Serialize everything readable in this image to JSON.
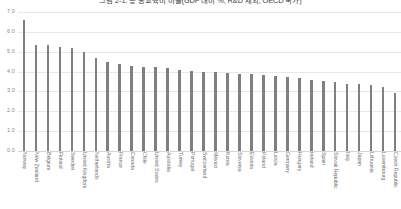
{
  "chart_data": {
    "type": "bar",
    "title": "그림 2-1. 총 공교육비 비율(GDP 대비 %, R&D 제외, OECD 국가)",
    "xlabel": "",
    "ylabel": "",
    "ylim": [
      0.0,
      7.0
    ],
    "grid": true,
    "legend": "none",
    "orientation": "vertical",
    "bar_color": "#7f7f7f",
    "ytick_labels": [
      "7.0",
      "6.0",
      "5.0",
      "4.0",
      "3.0",
      "2.0",
      "1.0",
      "0.0"
    ],
    "ytick_values": [
      7.0,
      6.0,
      5.0,
      4.0,
      3.0,
      2.0,
      1.0,
      0.0
    ],
    "categories": [
      "Norway",
      "New Zealand",
      "Belgium",
      "Finland",
      "Sweden",
      "United Kingdom",
      "Netherlands",
      "Austria",
      "France",
      "Canada",
      "Chile",
      "United States",
      "Australia",
      "Turkey",
      "Portugal",
      "Switzerland",
      "Mexico",
      "Korea",
      "Slovenia",
      "Estonia",
      "Poland",
      "Latvia",
      "Germany",
      "Hungary",
      "Ireland",
      "Spain",
      "Slovak Republic",
      "Italy",
      "Japan",
      "Lithuania",
      "Luxembourg",
      "Czech Republic"
    ],
    "values": [
      6.6,
      5.35,
      5.35,
      5.25,
      5.2,
      5.0,
      4.7,
      4.5,
      4.4,
      4.3,
      4.25,
      4.25,
      4.2,
      4.1,
      4.05,
      4.0,
      4.0,
      3.95,
      3.9,
      3.9,
      3.85,
      3.8,
      3.75,
      3.7,
      3.6,
      3.55,
      3.5,
      3.4,
      3.35,
      3.3,
      3.2,
      2.9
    ]
  }
}
